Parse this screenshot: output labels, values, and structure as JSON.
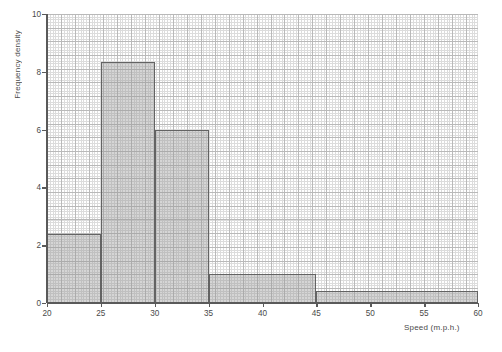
{
  "chart_data": {
    "type": "bar",
    "title": "",
    "subtitle": "",
    "xlabel": "Speed (m.p.h.)",
    "ylabel": "Frequency density",
    "xlim": [
      20,
      60
    ],
    "ylim": [
      0,
      10
    ],
    "grid": "graph-paper 1mm minor / 5mm major",
    "legend": "none",
    "legend_position": "none",
    "xticks": [
      20,
      25,
      30,
      35,
      40,
      45,
      50,
      55,
      60
    ],
    "xtick_labels": [
      "20",
      "25",
      "30",
      "35",
      "40",
      "45",
      "50",
      "55",
      "60"
    ],
    "yticks": [
      0,
      2,
      4,
      6,
      8,
      10
    ],
    "ytick_labels": [
      "0",
      "2",
      "4",
      "6",
      "8",
      "10"
    ],
    "bins": [
      {
        "label": "20-25",
        "x0": 20,
        "x1": 25,
        "value": 2.4
      },
      {
        "label": "25-30",
        "x0": 25,
        "x1": 30,
        "value": 8.35
      },
      {
        "label": "30-35",
        "x0": 30,
        "x1": 35,
        "value": 6.0
      },
      {
        "label": "35-45",
        "x0": 35,
        "x1": 45,
        "value": 1.0
      },
      {
        "label": "45-60",
        "x0": 45,
        "x1": 60,
        "value": 0.4
      }
    ],
    "categories": [
      "20-25",
      "25-30",
      "30-35",
      "35-45",
      "45-60"
    ],
    "values": [
      2.4,
      8.35,
      6.0,
      1.0,
      0.4
    ],
    "colors": {
      "bar_fill": "#b3b3b3",
      "bar_stroke": "#636363",
      "axis": "#5a5a5a",
      "grid_major": "#b9b9b9",
      "grid_minor": "#dcdcdc",
      "text": "#4a4a4a",
      "background": "#ffffff"
    }
  }
}
